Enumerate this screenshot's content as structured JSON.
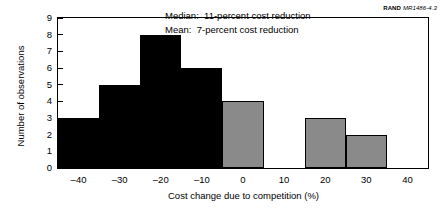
{
  "source_tag": {
    "brand": "RAND",
    "code": "MR1486-4.3"
  },
  "chart_data": {
    "type": "bar",
    "title": "",
    "xlabel": "Cost change due to competition (%)",
    "ylabel": "Number of observations",
    "categories": [
      "-40",
      "-30",
      "-20",
      "-10",
      "0",
      "10",
      "20",
      "30",
      "40"
    ],
    "x_tick_labels": [
      "–40",
      "–30",
      "–20",
      "–10",
      "0",
      "10",
      "20",
      "30",
      "40"
    ],
    "x_values": [
      -40,
      -30,
      -20,
      -10,
      0,
      10,
      20,
      30,
      40
    ],
    "values": [
      3,
      5,
      8,
      6,
      4,
      0,
      3,
      2,
      0
    ],
    "bar_colors": [
      "#000000",
      "#000000",
      "#000000",
      "#000000",
      "#8a8a8a",
      "#8a8a8a",
      "#8a8a8a",
      "#8a8a8a",
      "#8a8a8a"
    ],
    "y_tick_labels": [
      "0",
      "1",
      "2",
      "3",
      "4",
      "5",
      "6",
      "7",
      "8",
      "9"
    ],
    "y_values": [
      0,
      1,
      2,
      3,
      4,
      5,
      6,
      7,
      8,
      9
    ],
    "ylim": [
      0,
      9
    ],
    "xlim": [
      -45,
      45
    ],
    "grid": false,
    "legend": null,
    "annotations": [
      "Median:  11-percent cost reduction",
      "Mean:  7-percent cost reduction"
    ],
    "colors": {
      "bar_dark": "#000000",
      "bar_light": "#8a8a8a",
      "axis": "#000000",
      "background": "#ffffff"
    }
  }
}
